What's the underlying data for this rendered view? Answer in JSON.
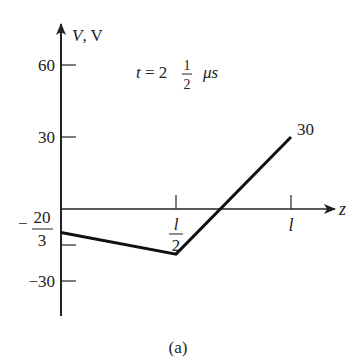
{
  "chart_data": {
    "type": "line",
    "title": "",
    "annotation": {
      "prefix": "t = 2",
      "frac_num": "1",
      "frac_den": "2",
      "unit": "μs"
    },
    "caption": "(a)",
    "ylabel": "V, V",
    "xlabel": "z",
    "ylim": [
      -45,
      70
    ],
    "xlim": [
      0,
      1.15
    ],
    "y_ticks": [
      {
        "value": 60,
        "label": "60"
      },
      {
        "value": 30,
        "label": "30"
      },
      {
        "value": -15,
        "label_minus": "−",
        "label_num": "20",
        "label_den": "3"
      },
      {
        "value": -30,
        "label": "−30"
      }
    ],
    "x_ticks": [
      {
        "value": 0.5,
        "label_num": "l",
        "label_den": "2"
      },
      {
        "value": 1.0,
        "label": "l"
      }
    ],
    "series": [
      {
        "name": "V(z)",
        "x": [
          0,
          0.5,
          1.0
        ],
        "y": [
          -9.8,
          -18.8,
          30
        ],
        "end_label": "30"
      }
    ],
    "grid": false,
    "legend": "none"
  }
}
